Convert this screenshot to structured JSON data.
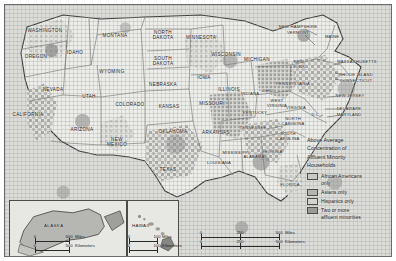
{
  "figure": {
    "type": "choropleth-map",
    "region": "United States"
  },
  "legend": {
    "title_lines": [
      "Above Average",
      "Concentration of",
      "Affluent Minority",
      "Households"
    ],
    "title": "Above Average Concentration of Affluent Minority Households",
    "items": [
      {
        "label": "African Americans only",
        "label_lines": [
          "African Americans",
          "only"
        ],
        "color": "#c9c9c6"
      },
      {
        "label": "Asians only",
        "label_lines": [
          "Asians only"
        ],
        "color": "#b4b4b1"
      },
      {
        "label": "Hispanics only",
        "label_lines": [
          "Hispanics only"
        ],
        "color": "#d3d3d0"
      },
      {
        "label": "Two or more affluent minorities",
        "label_lines": [
          "Two or more",
          "affluent minorities"
        ],
        "color": "#9a9a97"
      }
    ]
  },
  "scale_bars": {
    "main": {
      "miles": {
        "ticks": [
          "0",
          "250",
          "500"
        ],
        "unit": "Miles"
      },
      "kilometers": {
        "ticks": [
          "0",
          "250",
          "500"
        ],
        "unit": "Kilometers"
      }
    },
    "alaska": {
      "miles": {
        "ticks": [
          "0",
          "500"
        ],
        "unit": "Miles"
      },
      "kilometers": {
        "ticks": [
          "0",
          "500"
        ],
        "unit": "Kilometers"
      }
    },
    "hawaii": {
      "miles": {
        "ticks": [
          "0",
          "100"
        ],
        "unit": "Miles"
      },
      "kilometers": {
        "ticks": [
          "0",
          "100"
        ],
        "unit": "Kilometers"
      }
    }
  },
  "insets": [
    {
      "name": "ALASKA"
    },
    {
      "name": "HAWAII"
    }
  ],
  "states": [
    {
      "name": "WASHINGTON",
      "lines": [
        "WASHINGTON"
      ],
      "x": 40,
      "y": 26,
      "size": "n"
    },
    {
      "name": "OREGON",
      "lines": [
        "OREGON"
      ],
      "x": 31,
      "y": 52,
      "size": "n"
    },
    {
      "name": "IDAHO",
      "lines": [
        "IDAHO"
      ],
      "x": 70,
      "y": 48,
      "size": "n"
    },
    {
      "name": "MONTANA",
      "lines": [
        "MONTANA"
      ],
      "x": 110,
      "y": 31,
      "size": "n"
    },
    {
      "name": "WYOMING",
      "lines": [
        "WYOMING"
      ],
      "x": 107,
      "y": 67,
      "size": "n"
    },
    {
      "name": "NEVADA",
      "lines": [
        "NEVADA"
      ],
      "x": 48,
      "y": 85,
      "size": "n"
    },
    {
      "name": "UTAH",
      "lines": [
        "UTAH"
      ],
      "x": 84,
      "y": 92,
      "size": "n"
    },
    {
      "name": "CALIFORNIA",
      "lines": [
        "CALIFORNIA"
      ],
      "x": 23,
      "y": 110,
      "size": "n"
    },
    {
      "name": "ARIZONA",
      "lines": [
        "ARIZONA"
      ],
      "x": 77,
      "y": 125,
      "size": "n"
    },
    {
      "name": "COLORADO",
      "lines": [
        "COLORADO"
      ],
      "x": 125,
      "y": 100,
      "size": "n"
    },
    {
      "name": "NEW MEXICO",
      "lines": [
        "NEW",
        "MEXICO"
      ],
      "x": 112,
      "y": 137,
      "size": "n"
    },
    {
      "name": "NORTH DAKOTA",
      "lines": [
        "NORTH",
        "DAKOTA"
      ],
      "x": 158,
      "y": 30,
      "size": "n"
    },
    {
      "name": "SOUTH DAKOTA",
      "lines": [
        "SOUTH",
        "DAKOTA"
      ],
      "x": 158,
      "y": 56,
      "size": "n"
    },
    {
      "name": "NEBRASKA",
      "lines": [
        "NEBRASKA"
      ],
      "x": 158,
      "y": 80,
      "size": "n"
    },
    {
      "name": "KANSAS",
      "lines": [
        "KANSAS"
      ],
      "x": 164,
      "y": 102,
      "size": "n"
    },
    {
      "name": "OKLAHOMA",
      "lines": [
        "OKLAHOMA"
      ],
      "x": 168,
      "y": 127,
      "size": "n"
    },
    {
      "name": "TEXAS",
      "lines": [
        "TEXAS"
      ],
      "x": 163,
      "y": 165,
      "size": "n"
    },
    {
      "name": "MINNESOTA",
      "lines": [
        "MINNESOTA"
      ],
      "x": 196,
      "y": 33,
      "size": "n"
    },
    {
      "name": "IOWA",
      "lines": [
        "IOWA"
      ],
      "x": 199,
      "y": 73,
      "size": "n"
    },
    {
      "name": "MISSOURI",
      "lines": [
        "MISSOURI"
      ],
      "x": 207,
      "y": 99,
      "size": "n"
    },
    {
      "name": "ARKANSAS",
      "lines": [
        "ARKANSAS"
      ],
      "x": 211,
      "y": 128,
      "size": "n"
    },
    {
      "name": "LOUISIANA",
      "lines": [
        "LOUISIANA"
      ],
      "x": 214,
      "y": 158,
      "size": "sm"
    },
    {
      "name": "WISCONSIN",
      "lines": [
        "WISCONSIN"
      ],
      "x": 221,
      "y": 50,
      "size": "n"
    },
    {
      "name": "ILLINOIS",
      "lines": [
        "ILLINOIS"
      ],
      "x": 224,
      "y": 85,
      "size": "n"
    },
    {
      "name": "MICHIGAN",
      "lines": [
        "MICHIGAN"
      ],
      "x": 252,
      "y": 55,
      "size": "n"
    },
    {
      "name": "INDIANA",
      "lines": [
        "INDIANA"
      ],
      "x": 245,
      "y": 89,
      "size": "sm"
    },
    {
      "name": "OHIO",
      "lines": [
        "OHIO"
      ],
      "x": 263,
      "y": 86,
      "size": "sm"
    },
    {
      "name": "KENTUCKY",
      "lines": [
        "KENTUCKY"
      ],
      "x": 250,
      "y": 108,
      "size": "sm"
    },
    {
      "name": "TENNESSEE",
      "lines": [
        "TENNESSEE"
      ],
      "x": 248,
      "y": 123,
      "size": "sm"
    },
    {
      "name": "MISSISSIPPI",
      "lines": [
        "MISSISSIPPI"
      ],
      "x": 231,
      "y": 148,
      "size": "sm"
    },
    {
      "name": "ALABAMA",
      "lines": [
        "ALABAMA"
      ],
      "x": 249,
      "y": 152,
      "size": "sm"
    },
    {
      "name": "GEORGIA",
      "lines": [
        "GEORGIA"
      ],
      "x": 267,
      "y": 147,
      "size": "sm"
    },
    {
      "name": "FLORIDA",
      "lines": [
        "FLORIDA"
      ],
      "x": 285,
      "y": 180,
      "size": "sm"
    },
    {
      "name": "SOUTH CAROLINA",
      "lines": [
        "SOUTH",
        "CAROLINA"
      ],
      "x": 283,
      "y": 132,
      "size": "sm"
    },
    {
      "name": "NORTH CAROLINA",
      "lines": [
        "NORTH",
        "CAROLINA"
      ],
      "x": 288,
      "y": 117,
      "size": "sm"
    },
    {
      "name": "VIRGINIA",
      "lines": [
        "VIRGINIA"
      ],
      "x": 291,
      "y": 103,
      "size": "sm"
    },
    {
      "name": "WEST VIRGINIA",
      "lines": [
        "WEST",
        "VIRGINIA"
      ],
      "x": 272,
      "y": 99,
      "size": "sm"
    },
    {
      "name": "PENNSYLVANIA",
      "lines": [
        "PENNSYLVANIA"
      ],
      "x": 288,
      "y": 79,
      "size": "sm"
    },
    {
      "name": "NEW YORK",
      "lines": [
        "NEW",
        "YORK"
      ],
      "x": 294,
      "y": 60,
      "size": "sm"
    },
    {
      "name": "MAINE",
      "lines": [
        "MAINE"
      ],
      "x": 327,
      "y": 32,
      "size": "sm"
    },
    {
      "name": "NEW HAMPSHIRE",
      "lines": [
        "NEW HAMPSHIRE"
      ],
      "x": 293,
      "y": 22,
      "size": "sm"
    },
    {
      "name": "VERMONT",
      "lines": [
        "VERMONT"
      ],
      "x": 293,
      "y": 28,
      "size": "sm"
    },
    {
      "name": "MASSACHUSETTS",
      "lines": [
        "MASSACHUSETTS"
      ],
      "x": 352,
      "y": 57,
      "size": "sm"
    },
    {
      "name": "RHODE ISLAND",
      "lines": [
        "RHODE ISLAND"
      ],
      "x": 351,
      "y": 70,
      "size": "sm"
    },
    {
      "name": "CONNECTICUT",
      "lines": [
        "CONNECTICUT"
      ],
      "x": 351,
      "y": 76,
      "size": "sm"
    },
    {
      "name": "NEW JERSEY",
      "lines": [
        "NEW JERSEY"
      ],
      "x": 345,
      "y": 91,
      "size": "sm"
    },
    {
      "name": "DELAWARE",
      "lines": [
        "DELAWARE"
      ],
      "x": 344,
      "y": 104,
      "size": "sm"
    },
    {
      "name": "MARYLAND",
      "lines": [
        "MARYLAND"
      ],
      "x": 344,
      "y": 110,
      "size": "sm"
    },
    {
      "name": "D.C.",
      "lines": [
        "D.C."
      ],
      "x": 311,
      "y": 110,
      "size": "sm"
    }
  ],
  "chart_data": {
    "type": "choropleth",
    "categories": [
      "African Americans only",
      "Asians only",
      "Hispanics only",
      "Two or more affluent minorities"
    ],
    "legend_position": "right"
  }
}
